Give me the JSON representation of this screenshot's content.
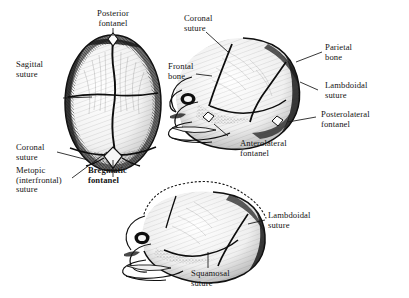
{
  "figure": {
    "background_color": "#ffffff",
    "ink_color": "#141414",
    "views": [
      {
        "name": "superior-view",
        "description": "Superior (top) view of fetal skull"
      },
      {
        "name": "lateral-view-right",
        "description": "Lateral view of fetal skull facing left, upper right"
      },
      {
        "name": "lateral-view-bottom",
        "description": "Lateral view of fetal skull facing left, bottom center"
      }
    ]
  },
  "labels": {
    "posterior_fontanel": {
      "line1": "Posterior",
      "line2": "fontanel"
    },
    "sagittal_suture": {
      "line1": "Sagittal",
      "line2": "suture"
    },
    "coronal_suture_left": {
      "line1": "Coronal",
      "line2": "suture"
    },
    "metopic_suture": {
      "line1": "Metopic",
      "line2": "(interfrontal)",
      "line3": "suture"
    },
    "bregmatic_fontanel": {
      "line1": "Bregmatic",
      "line2": "fontanel"
    },
    "coronal_suture_right": {
      "line1": "Coronal",
      "line2": "suture"
    },
    "frontal_bone": {
      "line1": "Frontal",
      "line2": "bone"
    },
    "parietal_bone": {
      "line1": "Parietal",
      "line2": "bone"
    },
    "lambdoidal_suture_upper": {
      "line1": "Lambdoidal",
      "line2": "suture"
    },
    "posterolateral_fontanel": {
      "line1": "Posterolateral",
      "line2": "fontanel"
    },
    "anterolateral_fontanel": {
      "line1": "Anterolateral",
      "line2": "fontanel"
    },
    "lambdoidal_suture_lower": {
      "line1": "Lambdoidal",
      "line2": "suture"
    },
    "squamosal_suture": {
      "line1": "Squamosal",
      "line2": "suture"
    }
  }
}
